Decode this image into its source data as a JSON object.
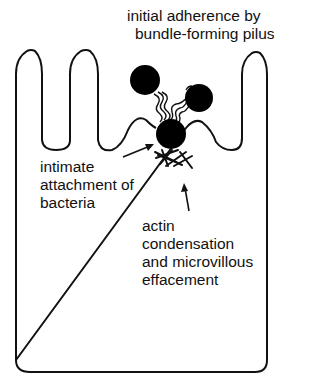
{
  "figure": {
    "type": "schematic"
  },
  "labels": {
    "top": [
      "initial adherence by",
      "bundle-forming pilus"
    ],
    "left": [
      "intimate",
      "attachment of",
      "bacteria"
    ],
    "bottom": [
      "actin",
      "condensation",
      "and microvillous",
      "effacement"
    ]
  },
  "elements": {
    "cell_outline": "epithelial cell with microvilli",
    "microvilli_count": 3,
    "bacteria_count": 3,
    "pili": "bundle-forming pili connecting bacteria",
    "actin": "condensed actin pedestal beneath attached bacterium",
    "arrows": [
      "arrow to attached bacterium",
      "arrow to actin condensation"
    ]
  },
  "colors": {
    "stroke": "#111111",
    "fill": "#000000",
    "background": "#ffffff"
  }
}
